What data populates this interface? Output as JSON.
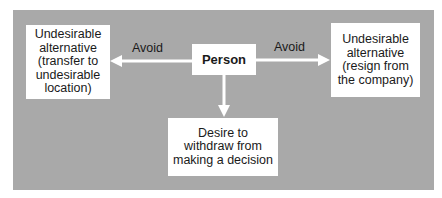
{
  "diagram": {
    "center": {
      "label": "Person"
    },
    "left": {
      "text": "Undesirable\nalternative\n(transfer to\nundesirable\nlocation)",
      "edge_label": "Avoid"
    },
    "right": {
      "text": "Undesirable\nalternative\n(resign from\nthe company)",
      "edge_label": "Avoid"
    },
    "bottom": {
      "text": "Desire to\nwithdraw from\nmaking a decision"
    },
    "colors": {
      "panel": "#a9a9a9",
      "box": "#ffffff",
      "arrow": "#ffffff",
      "text": "#1a1a1a"
    }
  }
}
